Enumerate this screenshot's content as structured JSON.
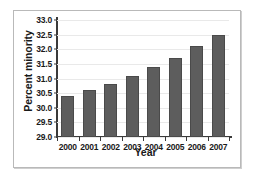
{
  "chart_data": {
    "type": "bar",
    "title": "",
    "xlabel": "Year",
    "ylabel": "Percent minority",
    "categories": [
      "2000",
      "2001",
      "2002",
      "2003",
      "2004",
      "2005",
      "2006",
      "2007"
    ],
    "values": [
      30.4,
      30.6,
      30.8,
      31.1,
      31.4,
      31.7,
      32.1,
      32.5
    ],
    "ylim": [
      29.0,
      33.0
    ],
    "yticks": [
      "29.0",
      "29.5",
      "30.0",
      "30.5",
      "31.0",
      "31.5",
      "32.0",
      "32.5",
      "33.0"
    ],
    "ytick_values": [
      29.0,
      29.5,
      30.0,
      30.5,
      31.0,
      31.5,
      32.0,
      32.5,
      33.0
    ],
    "grid": true,
    "legend": "none",
    "bar_color": "#5d5d5d",
    "grid_color": "#e9e9e9",
    "axis_color": "#3a3a3a",
    "frame_color": "#b9b9b9",
    "background": "#ffffff"
  }
}
